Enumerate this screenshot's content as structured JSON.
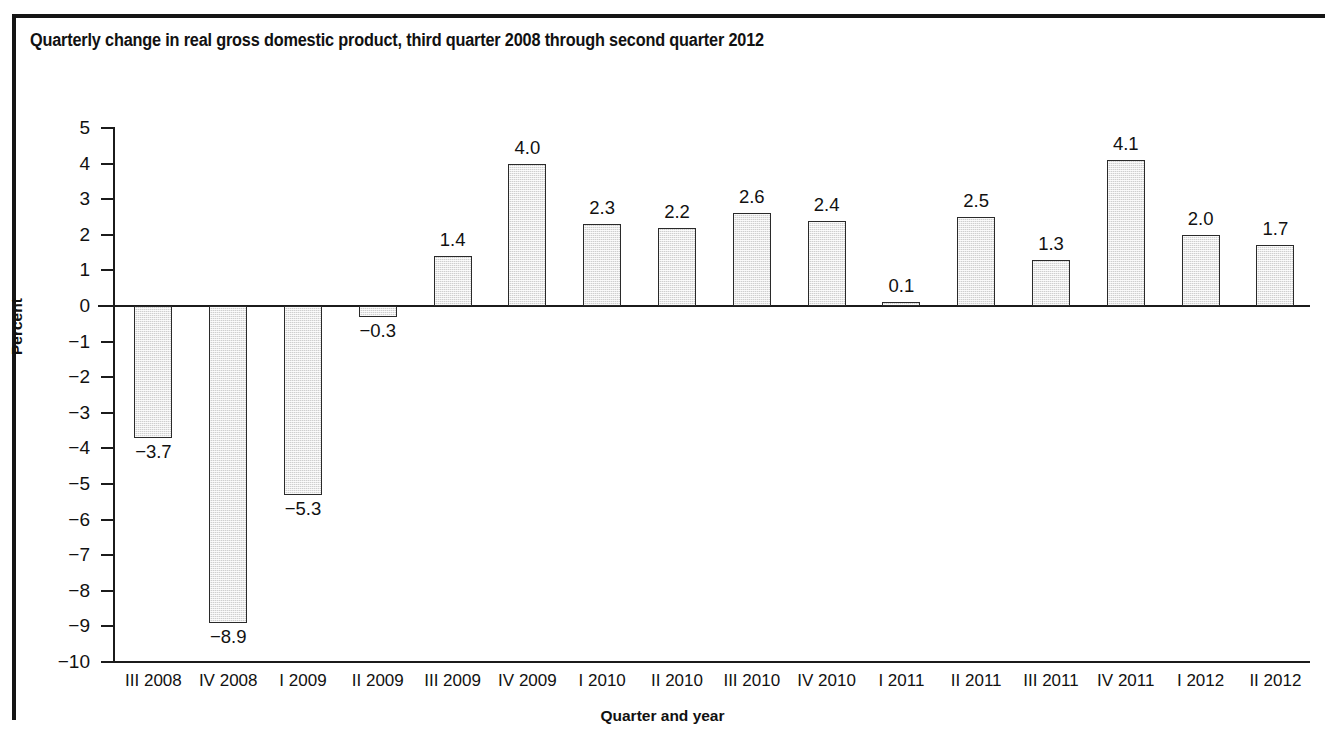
{
  "figure": {
    "title": "Quarterly change in real gross domestic product, third quarter 2008 through second quarter 2012"
  },
  "chart_data": {
    "type": "bar",
    "title": "Quarterly change in real gross domestic product, third quarter 2008 through second quarter 2012",
    "xlabel": "Quarter and year",
    "ylabel": "Percent",
    "ylim": [
      -10,
      5
    ],
    "yticks": [
      5,
      4,
      3,
      2,
      1,
      0,
      -1,
      -2,
      -3,
      -4,
      -5,
      -6,
      -7,
      -8,
      -9,
      -10
    ],
    "ytick_labels": [
      "5",
      "4",
      "3",
      "2",
      "1",
      "0",
      "−1",
      "−2",
      "−3",
      "−4",
      "−5",
      "−6",
      "−7",
      "−8",
      "−9",
      "−10"
    ],
    "grid": false,
    "legend": false,
    "categories": [
      "III 2008",
      "IV 2008",
      "I 2009",
      "II 2009",
      "III 2009",
      "IV 2009",
      "I 2010",
      "II 2010",
      "III 2010",
      "IV 2010",
      "I 2011",
      "II 2011",
      "III 2011",
      "IV 2011",
      "I 2012",
      "II 2012"
    ],
    "values": [
      -3.7,
      -8.9,
      -5.3,
      -0.3,
      1.4,
      4.0,
      2.3,
      2.2,
      2.6,
      2.4,
      0.1,
      2.5,
      1.3,
      4.1,
      2.0,
      1.7
    ],
    "value_labels": [
      "−3.7",
      "−8.9",
      "−5.3",
      "−0.3",
      "1.4",
      "4.0",
      "2.3",
      "2.2",
      "2.6",
      "2.4",
      "0.1",
      "2.5",
      "1.3",
      "4.1",
      "2.0",
      "1.7"
    ],
    "bar_fill_color": "#cfcfcf",
    "bar_border_color": "#2a2a2a",
    "axis_color": "#1b1b1b",
    "text_color": "#111111",
    "background_color": "#ffffff"
  }
}
